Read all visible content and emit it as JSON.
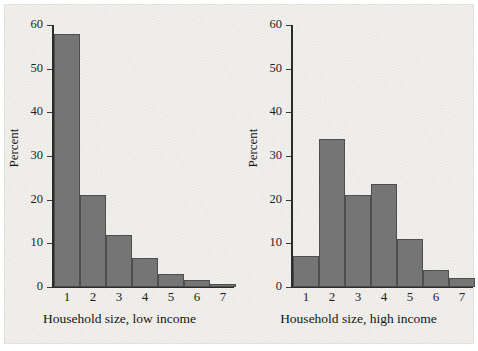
{
  "figure": {
    "background_color": "#f1efec",
    "bar_color": "#757575",
    "bar_edge_color": "#4e4e4e",
    "axis_color": "#2b2b2b",
    "text_color": "#151515"
  },
  "chart_data": [
    {
      "type": "bar",
      "title": "",
      "xlabel": "Household size, low income",
      "ylabel": "Percent",
      "categories": [
        "1",
        "2",
        "3",
        "4",
        "5",
        "6",
        "7"
      ],
      "values": [
        58,
        21,
        12,
        6.7,
        3,
        1.7,
        0.8
      ],
      "ylim": [
        0,
        60
      ],
      "yticks": [
        0,
        10,
        20,
        30,
        40,
        50,
        60
      ],
      "ytick_labels": [
        "0",
        "10",
        "20",
        "30",
        "40",
        "50",
        "60"
      ],
      "grid": false,
      "legend": "none"
    },
    {
      "type": "bar",
      "title": "",
      "xlabel": "Household size, high income",
      "ylabel": "Percent",
      "categories": [
        "1",
        "2",
        "3",
        "4",
        "5",
        "6",
        "7"
      ],
      "values": [
        7,
        34,
        21,
        23.7,
        11,
        4,
        2
      ],
      "ylim": [
        0,
        60
      ],
      "yticks": [
        0,
        10,
        20,
        30,
        40,
        50,
        60
      ],
      "ytick_labels": [
        "0",
        "10",
        "20",
        "30",
        "40",
        "50",
        "60"
      ],
      "grid": false,
      "legend": "none"
    }
  ]
}
